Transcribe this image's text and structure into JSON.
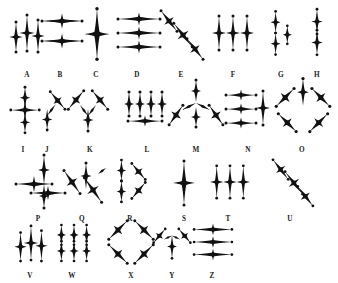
{
  "figure": {
    "title": "",
    "background_color": "#ffffff",
    "ink_color": "#111111",
    "width": 338,
    "height": 283
  },
  "chart_data": {
    "type": "table",
    "title": "",
    "xlabel": "",
    "ylabel": "",
    "grid": false,
    "legend_position": "none",
    "categories": [
      "A",
      "B",
      "C",
      "D",
      "E",
      "F",
      "G",
      "H",
      "I",
      "J",
      "K",
      "L",
      "M",
      "N",
      "O",
      "P",
      "Q",
      "R",
      "S",
      "T",
      "U",
      "V",
      "W",
      "X",
      "Y",
      "Z"
    ],
    "values": [
      3,
      2,
      1,
      3,
      3,
      3,
      3,
      2,
      3,
      2,
      3,
      4,
      4,
      4,
      5,
      4,
      3,
      3,
      1,
      3,
      3,
      3,
      6,
      4,
      3,
      3
    ],
    "series": [
      {
        "name": "star_count_per_specimen",
        "values": [
          3,
          2,
          1,
          3,
          3,
          3,
          3,
          2,
          3,
          2,
          3,
          4,
          4,
          4,
          5,
          4,
          3,
          3,
          1,
          3,
          3,
          3,
          6,
          4,
          3,
          3
        ]
      }
    ]
  },
  "rows": [
    {
      "row_label": "row-1",
      "label_y": 71,
      "cells": [
        {
          "letter": "A",
          "label_x": 27,
          "x": 27,
          "y": 33,
          "kind": "cluster3-v",
          "scale": 1.0,
          "rotate": 0
        },
        {
          "letter": "B",
          "label_x": 60,
          "x": 62,
          "y": 31,
          "kind": "stack2-h",
          "scale": 1.0,
          "rotate": 0
        },
        {
          "letter": "C",
          "label_x": 96,
          "x": 97,
          "y": 34,
          "kind": "single-big",
          "scale": 1.15,
          "rotate": 0
        },
        {
          "letter": "D",
          "label_x": 137,
          "x": 139,
          "y": 33,
          "kind": "stack3-h",
          "scale": 1.0,
          "rotate": 0
        },
        {
          "letter": "E",
          "label_x": 181,
          "x": 181,
          "y": 33,
          "kind": "diag3",
          "scale": 1.0,
          "rotate": 0
        },
        {
          "letter": "F",
          "label_x": 233,
          "x": 233,
          "y": 33,
          "kind": "triple-v",
          "scale": 1.0,
          "rotate": 0
        },
        {
          "letter": "G",
          "label_x": 281,
          "x": 281,
          "y": 33,
          "kind": "offset3",
          "scale": 0.9,
          "rotate": 0
        },
        {
          "letter": "H",
          "label_x": 317,
          "x": 317,
          "y": 33,
          "kind": "pair-v",
          "scale": 0.95,
          "rotate": 0
        }
      ]
    },
    {
      "row_label": "row-2",
      "label_y": 146,
      "cells": [
        {
          "letter": "I",
          "label_x": 23,
          "x": 25,
          "y": 110,
          "kind": "cross-v3",
          "scale": 0.95,
          "rotate": 0
        },
        {
          "letter": "J",
          "label_x": 47,
          "x": 50,
          "y": 110,
          "kind": "elbow",
          "scale": 0.95,
          "rotate": 0
        },
        {
          "letter": "K",
          "label_x": 90,
          "x": 88,
          "y": 110,
          "kind": "wye",
          "scale": 1.0,
          "rotate": 0
        },
        {
          "letter": "L",
          "label_x": 147,
          "x": 145,
          "y": 110,
          "kind": "comb4",
          "scale": 1.0,
          "rotate": 0
        },
        {
          "letter": "M",
          "label_x": 196,
          "x": 196,
          "y": 109,
          "kind": "fan5",
          "scale": 1.0,
          "rotate": 0
        },
        {
          "letter": "N",
          "label_x": 248,
          "x": 249,
          "y": 109,
          "kind": "ladder4",
          "scale": 1.0,
          "rotate": 0
        },
        {
          "letter": "O",
          "label_x": 302,
          "x": 303,
          "y": 109,
          "kind": "radial5",
          "scale": 1.05,
          "rotate": 0
        }
      ]
    },
    {
      "row_label": "row-3",
      "label_y": 215,
      "cells": [
        {
          "letter": "P",
          "label_x": 38,
          "x": 40,
          "y": 182,
          "kind": "plexus4",
          "scale": 1.0,
          "rotate": 0
        },
        {
          "letter": "Q",
          "label_x": 82,
          "x": 84,
          "y": 182,
          "kind": "spray3",
          "scale": 1.0,
          "rotate": 0
        },
        {
          "letter": "R",
          "label_x": 130,
          "x": 130,
          "y": 181,
          "kind": "kay",
          "scale": 0.95,
          "rotate": 0
        },
        {
          "letter": "S",
          "label_x": 184,
          "x": 184,
          "y": 183,
          "kind": "single-big",
          "scale": 1.0,
          "rotate": 0
        },
        {
          "letter": "T",
          "label_x": 228,
          "x": 230,
          "y": 182,
          "kind": "triple-v",
          "scale": 0.95,
          "rotate": 0
        },
        {
          "letter": "U",
          "label_x": 290,
          "x": 292,
          "y": 181,
          "kind": "diag3",
          "scale": 0.95,
          "rotate": 0
        }
      ]
    },
    {
      "row_label": "row-4",
      "label_y": 272,
      "cells": [
        {
          "letter": "V",
          "label_x": 30,
          "x": 31,
          "y": 243,
          "kind": "cluster3-v",
          "scale": 0.95,
          "rotate": 0
        },
        {
          "letter": "W",
          "label_x": 72,
          "x": 74,
          "y": 243,
          "kind": "grid6",
          "scale": 0.9,
          "rotate": 0
        },
        {
          "letter": "X",
          "label_x": 131,
          "x": 131,
          "y": 242,
          "kind": "ex4",
          "scale": 1.0,
          "rotate": 0
        },
        {
          "letter": "Y",
          "label_x": 172,
          "x": 172,
          "y": 243,
          "kind": "why3",
          "scale": 0.9,
          "rotate": 0
        },
        {
          "letter": "Z",
          "label_x": 212,
          "x": 213,
          "y": 242,
          "kind": "stack3-h",
          "scale": 0.9,
          "rotate": 0
        }
      ]
    }
  ]
}
